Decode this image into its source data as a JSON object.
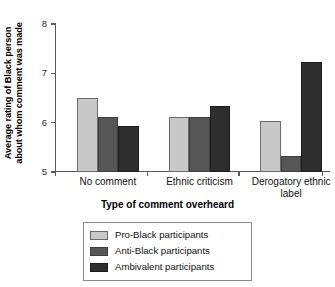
{
  "chart_data": {
    "type": "bar",
    "title": "",
    "categories": [
      "No comment",
      "Ethnic criticism",
      "Derogatory ethnic label"
    ],
    "category_lines": [
      [
        "No comment"
      ],
      [
        "Ethnic criticism"
      ],
      [
        "Derogatory ethnic",
        "label"
      ]
    ],
    "series": [
      {
        "name": "Pro-Black participants",
        "color": "#c8c8c8",
        "values": [
          6.5,
          6.12,
          6.04
        ]
      },
      {
        "name": "Anti-Black participants",
        "color": "#565656",
        "values": [
          6.12,
          6.12,
          5.33
        ]
      },
      {
        "name": "Ambivalent participants",
        "color": "#2e2e2e",
        "values": [
          5.93,
          6.33,
          7.22
        ]
      }
    ],
    "xlabel": "Type of comment overheard",
    "ylabel": "Average rating of Black person about whom comment was made",
    "ylabel_lines": [
      "Average rating of Black person",
      "about whom comment was made"
    ],
    "ylim": [
      5,
      8
    ],
    "yticks": [
      5,
      6,
      7,
      8
    ],
    "ytick_labels": [
      "5",
      "6",
      "7",
      "8"
    ],
    "grid": false,
    "legend_position": "below-axes"
  },
  "legend": {
    "entries": [
      {
        "label": "Pro-Black participants"
      },
      {
        "label": "Anti-Black participants"
      },
      {
        "label": "Ambivalent participants"
      }
    ]
  }
}
